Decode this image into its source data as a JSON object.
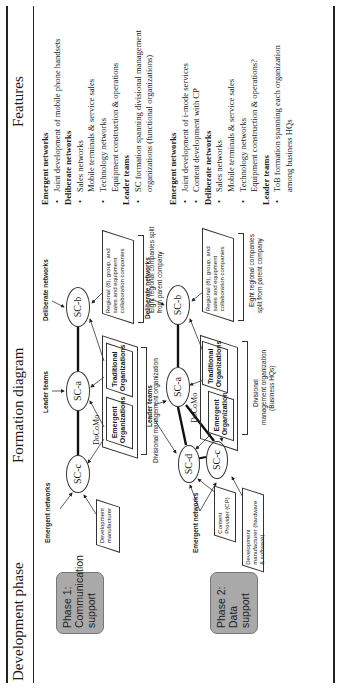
{
  "table": {
    "headers": {
      "phase": "Development phase",
      "diagram": "Formation diagram",
      "features": "Features"
    },
    "rows": [
      {
        "phase": {
          "line1": "Phase 1:",
          "line2": "Communication",
          "line3": "support"
        },
        "diagram": {
          "emergent_label": "Emergent networks",
          "leader_label": "Leader teams",
          "deliberate_label": "Deliberate networks",
          "nodes": {
            "sc_c": "SC-c",
            "sc_a": "SC-a",
            "sc_b": "SC-b"
          },
          "docomo": "DoCoMo",
          "dev_box": {
            "line1": "Development",
            "line2": "manufacturer"
          },
          "emergent_org": {
            "line1": "Emergent",
            "line2": "Organizations"
          },
          "traditional_org": {
            "line1": "Traditional",
            "line2": "Organizations"
          },
          "regional_box": {
            "line1": "Regional (8), group, and sales and",
            "line2": "equipment collaboration",
            "line3": "companies"
          },
          "divisional_caption": "Divisional management organization",
          "eight_caption": {
            "line1": "Eight regional companies split",
            "line2": "from parent company"
          }
        },
        "features": [
          {
            "type": "heading",
            "text": "Emergent networks"
          },
          {
            "type": "bullet",
            "text": "Joint development of mobile phone handsets"
          },
          {
            "type": "heading",
            "text": "Deliberate networks"
          },
          {
            "type": "bullet",
            "text": "Sales networks"
          },
          {
            "type": "cont",
            "text": "Mobile terminals & service sales"
          },
          {
            "type": "bullet",
            "text": "Technology networks"
          },
          {
            "type": "cont",
            "text": "Equipment construction & operations"
          },
          {
            "type": "heading",
            "text": "Leader teams"
          },
          {
            "type": "bullet",
            "text": "SC formation spanning divisional management"
          },
          {
            "type": "cont",
            "text": "organizations (functional organizations)"
          }
        ]
      },
      {
        "phase": {
          "line1": "Phase 2:",
          "line2": "Data support"
        },
        "diagram": {
          "emergent_label": "Emergent networks",
          "leader_label": "Leader teams",
          "deliberate_label": "Deliberate networks",
          "nodes": {
            "sc_d": "SC-d",
            "sc_c": "SC-c",
            "sc_a": "SC-a",
            "sc_b": "SC-b"
          },
          "docomo": "DoCoMo",
          "cp_box": {
            "line1": "Content Provider",
            "line2": "(CP)"
          },
          "dev_box": {
            "line1": "Development manufacturer",
            "line2": "(hardware & software)"
          },
          "emergent_org": {
            "line1": "Emergent",
            "line2": "Organizations"
          },
          "traditional_org": {
            "line1": "Traditional",
            "line2": "Organizations"
          },
          "regional_box": {
            "line1": "Regional (8), group, and sales and",
            "line2": "equipment collaboration",
            "line3": "companies"
          },
          "divisional_caption": {
            "line1": "Divisional",
            "line2": "management organization",
            "line3": "(Business HQs)"
          },
          "eight_caption": {
            "line1": "Eight regional companies",
            "line2": "split from parent company"
          }
        },
        "features": [
          {
            "type": "heading",
            "text": "Emergent networks"
          },
          {
            "type": "bullet",
            "text": "Joint development of i-mode services"
          },
          {
            "type": "bullet",
            "text": "Content development with CP"
          },
          {
            "type": "heading",
            "text": "Deliberate networks"
          },
          {
            "type": "bullet",
            "text": "Sales networks"
          },
          {
            "type": "cont",
            "text": "Mobile terminals & service sales"
          },
          {
            "type": "bullet",
            "text": "Technology networks"
          },
          {
            "type": "cont",
            "text": "Equipment construction & operations?"
          },
          {
            "type": "heading",
            "text": "Leader teams"
          },
          {
            "type": "bullet",
            "text": "ToB formation spanning each organization"
          },
          {
            "type": "cont",
            "text": "among business HQs"
          }
        ]
      }
    ]
  },
  "colors": {
    "phase_box_fill": "#a9a9a9",
    "rule": "#222222"
  }
}
